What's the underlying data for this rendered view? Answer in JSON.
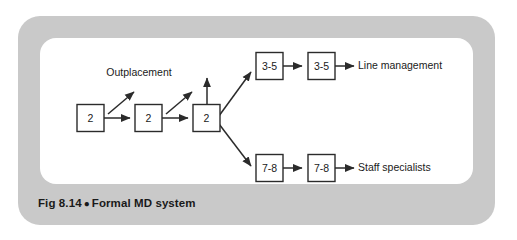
{
  "figure": {
    "caption_prefix": "Fig 8.14",
    "caption_bullet": "●",
    "caption_title": "Formal MD system",
    "frame_color": "#c9c9c9",
    "panel_color": "#ffffff",
    "ink_color": "#2b2b2b"
  },
  "diagram": {
    "type": "flowchart",
    "annotation": "Outplacement",
    "chain_nodes": [
      {
        "id": "stage-1",
        "label": "2"
      },
      {
        "id": "stage-2",
        "label": "2"
      },
      {
        "id": "stage-3",
        "label": "2"
      }
    ],
    "branches": [
      {
        "id": "upper-branch",
        "nodes": [
          {
            "id": "upper-node-1",
            "label": "3-5"
          },
          {
            "id": "upper-node-2",
            "label": "3-5"
          }
        ],
        "outcome": "Line management"
      },
      {
        "id": "lower-branch",
        "nodes": [
          {
            "id": "lower-node-1",
            "label": "7-8"
          },
          {
            "id": "lower-node-2",
            "label": "7-8"
          }
        ],
        "outcome": "Staff specialists"
      }
    ],
    "outplacement_arrows": 3
  }
}
